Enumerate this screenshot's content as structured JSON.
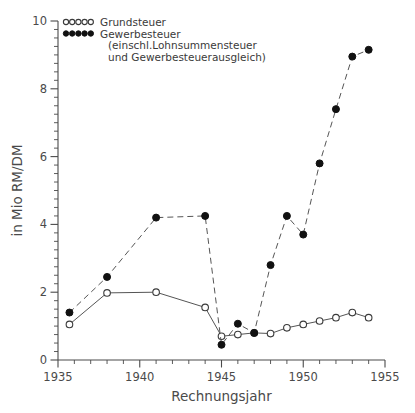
{
  "chart_data": {
    "type": "line",
    "title": "",
    "xlabel": "Rechnungsjahr",
    "ylabel": "in Mio RM/DM",
    "xlim": [
      1935,
      1955
    ],
    "ylim": [
      0,
      10
    ],
    "xticks": [
      1935,
      1940,
      1945,
      1950,
      1955
    ],
    "xticklabels": [
      "1935",
      "1940",
      "1945",
      "1950",
      "1955"
    ],
    "yticks": [
      0,
      2,
      4,
      6,
      8,
      10
    ],
    "yticklabels": [
      "0",
      "2",
      "4",
      "6",
      "8",
      "10"
    ],
    "x_minor_step": 1,
    "y_minor_step": 0.25,
    "grid": false,
    "legend_position": "top-left",
    "series": [
      {
        "name": "Grundsteuer",
        "marker": "open-circle",
        "linestyle": "solid",
        "x": [
          1935.7,
          1938.0,
          1941.0,
          1944.0,
          1945.0,
          1946.0,
          1947.0,
          1948.0,
          1949.0,
          1950.0,
          1951.0,
          1952.0,
          1953.0,
          1954.0
        ],
        "values": [
          1.05,
          1.98,
          2.0,
          1.55,
          0.7,
          0.75,
          0.8,
          0.78,
          0.95,
          1.05,
          1.15,
          1.25,
          1.4,
          1.25
        ]
      },
      {
        "name": "Gewerbesteuer",
        "marker": "filled-circle",
        "linestyle": "dashed",
        "x": [
          1935.7,
          1938.0,
          1941.0,
          1944.0,
          1945.0,
          1946.0,
          1947.0,
          1948.0,
          1949.0,
          1950.0,
          1951.0,
          1952.0,
          1953.0,
          1954.0
        ],
        "values": [
          1.4,
          2.45,
          4.2,
          4.25,
          0.45,
          1.07,
          0.8,
          2.8,
          4.25,
          3.7,
          5.8,
          7.4,
          8.95,
          9.15
        ]
      }
    ],
    "legend": [
      {
        "label": "Grundsteuer",
        "marker": "open-circle"
      },
      {
        "label": "Gewerbesteuer",
        "marker": "filled-circle"
      }
    ],
    "legend_notes": [
      "(einschl.Lohnsummensteuer",
      "und  Gewerbesteuerausgleich)"
    ]
  }
}
